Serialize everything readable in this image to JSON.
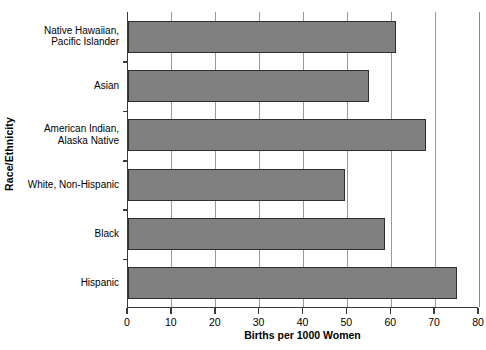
{
  "chart_data": {
    "type": "bar",
    "orientation": "horizontal",
    "title": "",
    "xlabel": "Births per 1000 Women",
    "ylabel": "Race/Ethnicity",
    "categories": [
      "Native Hawaiian, Pacific Islander",
      "Asian",
      "American Indian, Alaska Native",
      "White, Non-Hispanic",
      "Black",
      "Hispanic"
    ],
    "category_lines": [
      [
        "Native Hawaiian,",
        "Pacific Islander"
      ],
      [
        "Asian",
        ""
      ],
      [
        "American Indian,",
        "Alaska Native"
      ],
      [
        "White, Non-Hispanic",
        ""
      ],
      [
        "Black",
        ""
      ],
      [
        "Hispanic",
        ""
      ]
    ],
    "values": [
      61,
      55,
      68,
      49.5,
      58.5,
      75
    ],
    "xlim": [
      0,
      80
    ],
    "xticks": [
      0,
      10,
      20,
      30,
      40,
      50,
      60,
      70,
      80
    ],
    "xtick_labels": [
      "0",
      "10",
      "20",
      "30",
      "40",
      "50",
      "60",
      "70",
      "80"
    ],
    "grid": "vertical",
    "legend": "none",
    "bar_color": "#808080",
    "bar_border_color": "#2e2e2e",
    "grid_color": "#9a9a9a",
    "axis_color": "#3a3a3a"
  }
}
